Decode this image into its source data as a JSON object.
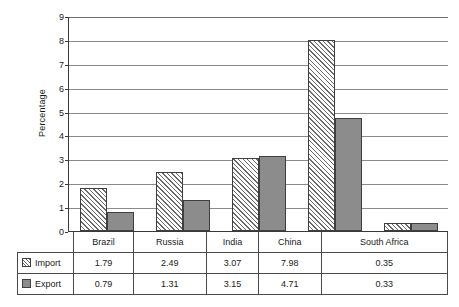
{
  "chart_data": {
    "type": "bar",
    "title": "",
    "xlabel": "",
    "ylabel": "Percentage",
    "ylim": [
      0,
      9
    ],
    "yticks": [
      "0",
      "1",
      "2",
      "3",
      "4",
      "5",
      "6",
      "7",
      "8",
      "9"
    ],
    "grid": true,
    "legend_position": "bottom-table",
    "categories": [
      "Brazil",
      "Russia",
      "India",
      "China",
      "South Africa"
    ],
    "series": [
      {
        "name": "Import",
        "swatch": "hatched-swatch",
        "values": [
          1.79,
          2.49,
          3.07,
          7.98,
          0.35
        ],
        "labels": [
          "1.79",
          "2.49",
          "3.07",
          "7.98",
          "0.35"
        ]
      },
      {
        "name": "Export",
        "swatch": "gray-swatch",
        "values": [
          0.79,
          1.31,
          3.15,
          4.71,
          0.33
        ],
        "labels": [
          "0.79",
          "1.31",
          "3.15",
          "4.71",
          "0.33"
        ]
      }
    ],
    "colors": {
      "import_fill": "#ffffff",
      "import_hatch": "#6a6a6a",
      "export_fill": "#8c8c8c",
      "bar_border": "#3f3f3f",
      "gridline": "#8a8a8a",
      "axis": "#3a3a3a",
      "table_border": "#4a4a4a",
      "text": "#1a1a1a"
    }
  }
}
